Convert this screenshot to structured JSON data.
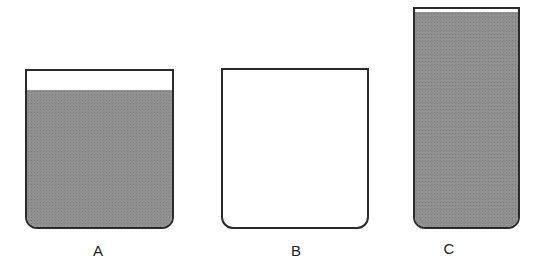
{
  "diagram": {
    "containers": [
      {
        "label": "A",
        "state": "mostly full",
        "fill_color": "#8f8f8f"
      },
      {
        "label": "B",
        "state": "empty"
      },
      {
        "label": "C",
        "state": "nearly full, taller and narrower",
        "fill_color": "#8f8f8f"
      }
    ]
  }
}
